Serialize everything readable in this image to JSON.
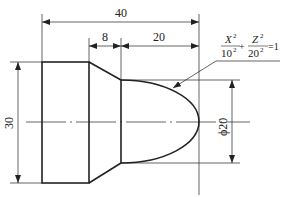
{
  "drawing": {
    "type": "turned part engineering drawing",
    "dimensions": {
      "overall_length": "40",
      "chamfer_length": "8",
      "ellipse_length": "20",
      "large_diameter": "30",
      "small_diameter": "ϕ20"
    },
    "equation": {
      "x_num": "X",
      "x_den": "10",
      "plus": "+",
      "z_num": "Z",
      "z_den": "20",
      "exp": "2",
      "equals": "=1"
    },
    "colors": {
      "line": "#222222",
      "background": "#ffffff"
    }
  }
}
